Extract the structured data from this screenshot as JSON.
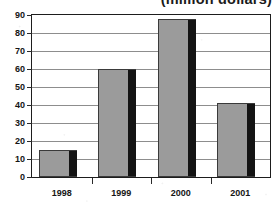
{
  "chart_data": {
    "type": "bar",
    "title": "(million dollars)",
    "xlabel": "",
    "ylabel": "",
    "categories": [
      "1998",
      "1999",
      "2000",
      "2001"
    ],
    "values": [
      15,
      60,
      88,
      41
    ],
    "ylim": [
      0,
      90
    ],
    "ytick_step": 10,
    "ytick_labels": [
      "0",
      "10",
      "20",
      "30",
      "40",
      "50",
      "60",
      "70",
      "80",
      "90"
    ],
    "grid": true,
    "legend": "none",
    "series": [
      {
        "name": "amount",
        "values": [
          15,
          60,
          88,
          41
        ]
      }
    ],
    "colors": {
      "bar_fill": "#9b9b9b",
      "bar_shadow": "#141414",
      "bar_outline": "#3a3a3a",
      "gridline": "#8d8d8d",
      "axis": "#1d1d1d",
      "text": "#151515",
      "background": "#ffffff"
    }
  }
}
